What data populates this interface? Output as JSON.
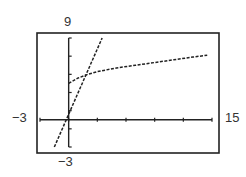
{
  "chart_data": {
    "type": "line",
    "title": "",
    "xlabel": "",
    "ylabel": "",
    "xlim": [
      -3,
      15
    ],
    "ylim": [
      -3,
      9
    ],
    "window_labels": {
      "ymax": "9",
      "ymin": "-3",
      "xmin": "-3",
      "xmax": "15"
    },
    "x_ticks_every": 3,
    "y_ticks_every": 2,
    "grid": false,
    "series": [
      {
        "name": "line",
        "style": "dotted",
        "x": [
          -1.5,
          3.5
        ],
        "y": [
          -3,
          9
        ]
      },
      {
        "name": "curve",
        "style": "dotted",
        "x": [
          0,
          1,
          2,
          3,
          5,
          7,
          9,
          11,
          13,
          14.5
        ],
        "y": [
          4.0,
          4.6,
          5.0,
          5.3,
          5.7,
          6.0,
          6.3,
          6.6,
          6.9,
          7.1
        ]
      }
    ]
  }
}
